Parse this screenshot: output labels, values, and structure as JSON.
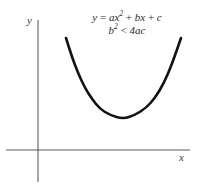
{
  "figure": {
    "background_color": "#ffffff",
    "width": 198,
    "height": 194
  },
  "axes": {
    "y_label": "y",
    "x_label": "x",
    "axis_color": "#5d5d5d",
    "x_axis": {
      "y": 150,
      "x_start": 6,
      "x_end": 190
    },
    "y_axis": {
      "x": 38,
      "y_start": 20,
      "y_end": 182
    }
  },
  "annotation": {
    "line1": {
      "lhs": "y",
      "eq": " = ",
      "term1_coef": "ax",
      "term1_exp": "2",
      "plus1": " + ",
      "term2": "bx",
      "plus2": " + ",
      "term3": "c"
    },
    "line2": {
      "lhs": "b",
      "lhs_exp": "2",
      "relation": " < ",
      "rhs": "4ac"
    }
  },
  "curve": {
    "color": "#121212",
    "stroke_width": 2.6,
    "vertex": {
      "x": 123,
      "y": 119
    },
    "left_end": {
      "x": 66,
      "y": 38
    },
    "right_end": {
      "x": 181,
      "y": 38
    }
  },
  "chart_data": {
    "type": "line",
    "title": "",
    "xlabel": "x",
    "ylabel": "y",
    "annotations": [
      "y = ax^2 + bx + c",
      "b^2 < 4ac"
    ],
    "grid": false,
    "legend": "none",
    "series": [
      {
        "name": "parabola",
        "description": "upward-opening parabola lying entirely above the x-axis (no real roots)",
        "points": [
          [
            66,
            38
          ],
          [
            72,
            57
          ],
          [
            78,
            73
          ],
          [
            85,
            88
          ],
          [
            92,
            99
          ],
          [
            100,
            109
          ],
          [
            110,
            115
          ],
          [
            123,
            119
          ],
          [
            135,
            115
          ],
          [
            146,
            108
          ],
          [
            155,
            98
          ],
          [
            164,
            83
          ],
          [
            172,
            64
          ],
          [
            181,
            38
          ]
        ]
      }
    ]
  }
}
